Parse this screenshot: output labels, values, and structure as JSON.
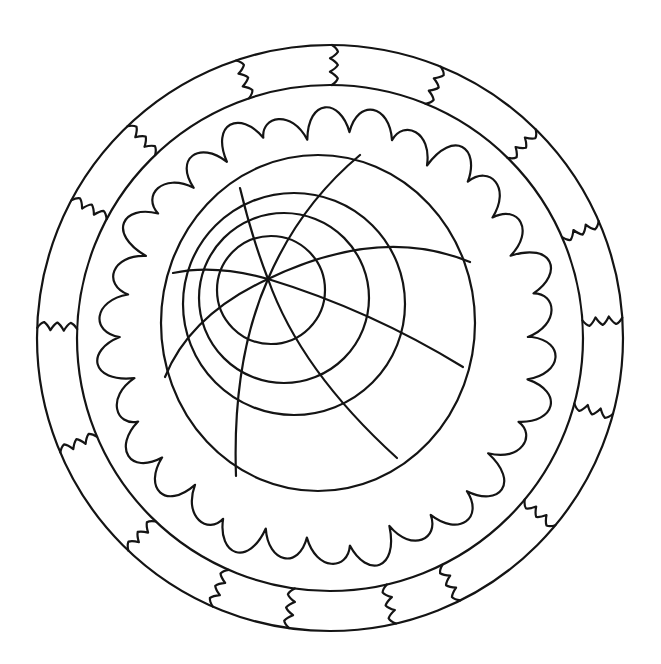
{
  "page": {
    "background": "#ffffff",
    "stroke": "#141414"
  },
  "mandala": {
    "center": [
      330,
      338
    ],
    "outer_ring_radius": 293,
    "inner_ring_radius": 253,
    "band_divider_angles_deg": [
      -178,
      -152,
      -133.7,
      -108.7,
      -89.6,
      -67.8,
      -45.4,
      -23.5,
      -4,
      15,
      39.7,
      63.6,
      77,
      98,
      113.6,
      133.5,
      157
    ],
    "scallop": {
      "center": [
        328,
        337
      ],
      "r_valley": 204,
      "r_peak": 224,
      "bumps": 30
    },
    "inner_circles": [
      {
        "cx": 318,
        "cy": 323,
        "rx": 157,
        "ry": 168
      },
      {
        "cx": 294,
        "cy": 304,
        "r": 111
      },
      {
        "cx": 284,
        "cy": 298,
        "r": 85
      },
      {
        "cx": 271,
        "cy": 290,
        "r": 54
      }
    ],
    "hub": [
      268,
      279
    ],
    "spokes": [
      {
        "to": [
          240,
          188
        ],
        "ctrl": [
          252,
          238
        ]
      },
      {
        "to": [
          360,
          155
        ],
        "ctrl": [
          300,
          205
        ]
      },
      {
        "to": [
          470,
          262
        ],
        "ctrl": [
          380,
          225
        ]
      },
      {
        "to": [
          463,
          367
        ],
        "ctrl": [
          370,
          310
        ]
      },
      {
        "to": [
          397,
          458
        ],
        "ctrl": [
          300,
          370
        ]
      },
      {
        "to": [
          236,
          476
        ],
        "ctrl": [
          232,
          360
        ]
      },
      {
        "to": [
          173,
          273
        ],
        "ctrl": [
          215,
          264
        ]
      },
      {
        "to": [
          165,
          377
        ],
        "ctrl": [
          190,
          315
        ]
      }
    ]
  }
}
